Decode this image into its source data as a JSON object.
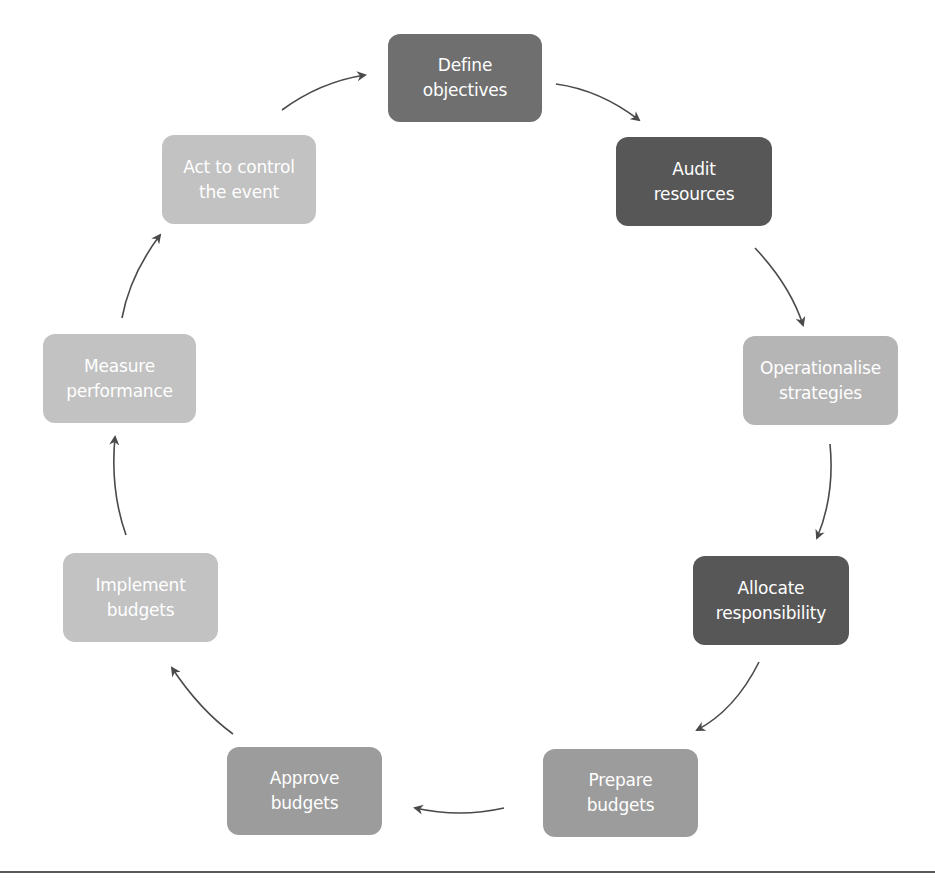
{
  "diagram": {
    "type": "cycle",
    "nodes": [
      {
        "id": "define-objectives",
        "line1": "Define",
        "line2": "objectives",
        "color": "#6f6f6f",
        "x": 388,
        "y": 34,
        "w": 154,
        "h": 88
      },
      {
        "id": "audit-resources",
        "line1": "Audit",
        "line2": "resources",
        "color": "#575757",
        "x": 616,
        "y": 137,
        "w": 156,
        "h": 89
      },
      {
        "id": "operationalise-strategies",
        "line1": "Operationalise",
        "line2": "strategies",
        "color": "#b5b5b5",
        "x": 743,
        "y": 336,
        "w": 155,
        "h": 89
      },
      {
        "id": "allocate-responsibility",
        "line1": "Allocate",
        "line2": "responsibility",
        "color": "#575757",
        "x": 693,
        "y": 556,
        "w": 156,
        "h": 89
      },
      {
        "id": "prepare-budgets",
        "line1": "Prepare",
        "line2": "budgets",
        "color": "#9c9c9c",
        "x": 543,
        "y": 749,
        "w": 155,
        "h": 88
      },
      {
        "id": "approve-budgets",
        "line1": "Approve",
        "line2": "budgets",
        "color": "#9c9c9c",
        "x": 227,
        "y": 747,
        "w": 155,
        "h": 88
      },
      {
        "id": "implement-budgets",
        "line1": "Implement",
        "line2": "budgets",
        "color": "#c2c2c2",
        "x": 63,
        "y": 553,
        "w": 155,
        "h": 89
      },
      {
        "id": "measure-performance",
        "line1": "Measure",
        "line2": "performance",
        "color": "#c2c2c2",
        "x": 43,
        "y": 334,
        "w": 153,
        "h": 89
      },
      {
        "id": "act-to-control",
        "line1": "Act to control",
        "line2": "the event",
        "color": "#c2c2c2",
        "x": 162,
        "y": 135,
        "w": 154,
        "h": 89
      }
    ],
    "edges": [
      {
        "from": "define-objectives",
        "to": "audit-resources"
      },
      {
        "from": "audit-resources",
        "to": "operationalise-strategies"
      },
      {
        "from": "operationalise-strategies",
        "to": "allocate-responsibility"
      },
      {
        "from": "allocate-responsibility",
        "to": "prepare-budgets"
      },
      {
        "from": "prepare-budgets",
        "to": "approve-budgets"
      },
      {
        "from": "approve-budgets",
        "to": "implement-budgets"
      },
      {
        "from": "implement-budgets",
        "to": "measure-performance"
      },
      {
        "from": "measure-performance",
        "to": "act-to-control"
      },
      {
        "from": "act-to-control",
        "to": "define-objectives"
      }
    ],
    "arrow_color": "#4a4a4a"
  }
}
